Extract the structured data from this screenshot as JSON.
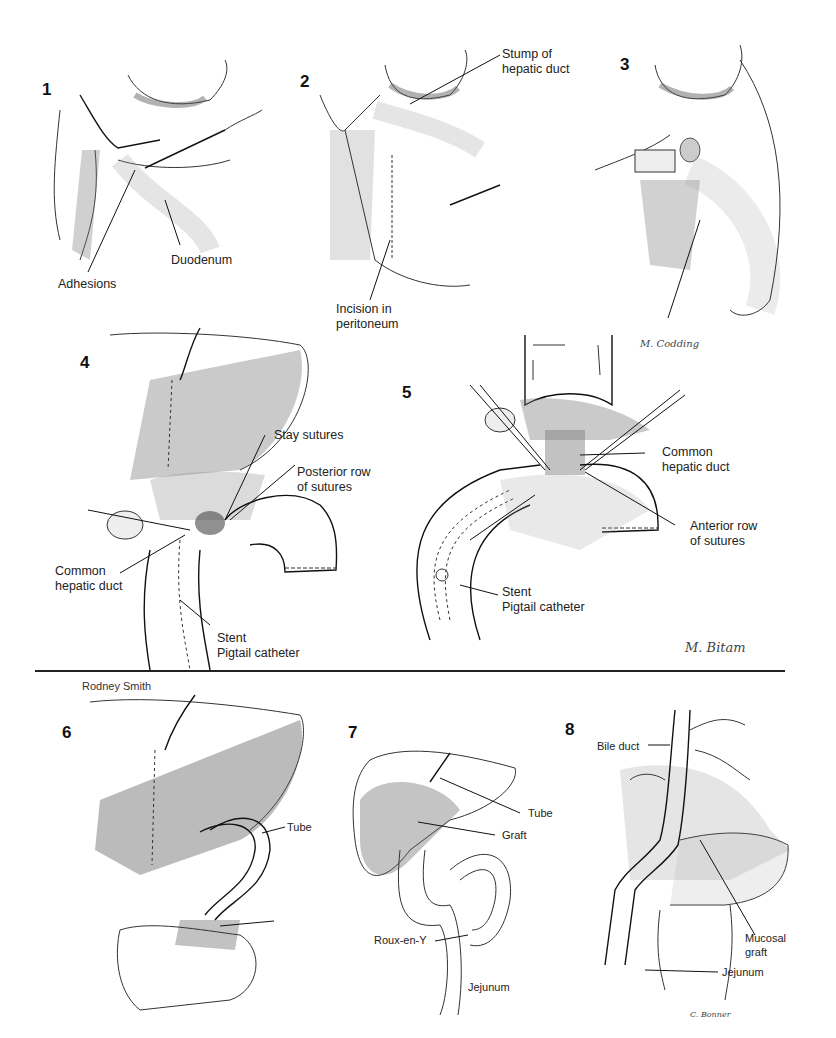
{
  "figure": {
    "panels": [
      {
        "number": "1",
        "labels": [
          "Adhesions",
          "Duodenum"
        ]
      },
      {
        "number": "2",
        "labels": [
          "Stump of\nhepatic duct",
          "Incision in\nperitoneum"
        ],
        "label_lines": {
          "stump_1": "Stump of",
          "stump_2": "hepatic duct",
          "incision_1": "Incision in",
          "incision_2": "peritoneum"
        }
      },
      {
        "number": "3",
        "labels": [],
        "signature": "M. Codding"
      },
      {
        "number": "4",
        "label_lines": {
          "stay": "Stay sutures",
          "posterior_1": "Posterior row",
          "posterior_2": "of sutures",
          "chd_1": "Common",
          "chd_2": "hepatic duct",
          "stent_1": "Stent",
          "stent_2": "Pigtail catheter"
        }
      },
      {
        "number": "5",
        "label_lines": {
          "chd_1": "Common",
          "chd_2": "hepatic duct",
          "anterior_1": "Anterior row",
          "anterior_2": "of sutures",
          "stent_1": "Stent",
          "stent_2": "Pigtail catheter"
        },
        "signature": "M. Bitam"
      },
      {
        "number": "6",
        "label_lines": {
          "tube": "Tube"
        }
      },
      {
        "number": "7",
        "label_lines": {
          "tube": "Tube",
          "graft": "Graft",
          "roux": "Roux-en-Y",
          "jejunum": "Jejunum"
        }
      },
      {
        "number": "8",
        "label_lines": {
          "bile": "Bile duct",
          "mucosal_1": "Mucosal",
          "mucosal_2": "graft",
          "jejunum": "Jejunum"
        },
        "signature": "C. Bonner"
      }
    ],
    "credit": "Rodney Smith"
  }
}
